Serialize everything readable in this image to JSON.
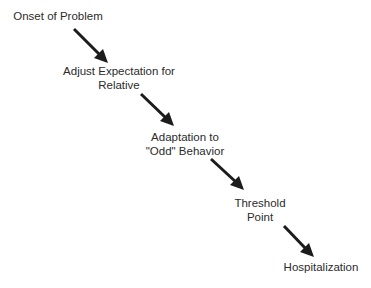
{
  "diagram": {
    "type": "flow",
    "direction": "top-left to bottom-right",
    "colors": {
      "text": "#2b2b2b",
      "arrow": "#1c1c1c",
      "background": "#ffffff"
    },
    "nodes": [
      {
        "id": "onset",
        "lines": [
          "Onset of Problem"
        ]
      },
      {
        "id": "adjust",
        "lines": [
          "Adjust Expectation for",
          "Relative"
        ]
      },
      {
        "id": "adaptation",
        "lines": [
          "Adaptation to",
          "\"Odd\" Behavior"
        ]
      },
      {
        "id": "threshold",
        "lines": [
          "Threshold",
          "Point"
        ]
      },
      {
        "id": "hospitalization",
        "lines": [
          "Hospitalization"
        ]
      }
    ],
    "edges": [
      {
        "from": "onset",
        "to": "adjust"
      },
      {
        "from": "adjust",
        "to": "adaptation"
      },
      {
        "from": "adaptation",
        "to": "threshold"
      },
      {
        "from": "threshold",
        "to": "hospitalization"
      }
    ]
  }
}
